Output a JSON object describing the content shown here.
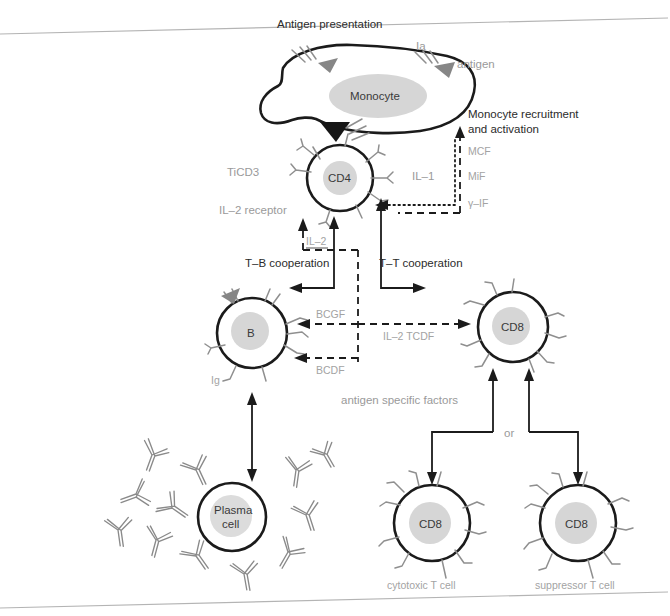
{
  "figure": {
    "title": "Antigen presentation",
    "domain": "immunology-cell-interaction-diagram"
  },
  "labels": {
    "antigen_presentation": "Antigen presentation",
    "ia": "Ia",
    "antigen": "antigen",
    "monocyte": "Monocyte",
    "monocyte_recruitment_line1": "Monocyte recruitment",
    "monocyte_recruitment_line2": "and activation",
    "mcf": "MCF",
    "mif": "MiF",
    "gamma_if": "γ–IF",
    "il1": "IL–1",
    "ticd3": "TiCD3",
    "cd4": "CD4",
    "il2_receptor": "IL–2 receptor",
    "il2": "IL–2",
    "tb_cooperation": "T–B cooperation",
    "tt_cooperation": "T–T cooperation",
    "b_cell": "B",
    "ig": "Ig",
    "bcgf": "BCGF",
    "bcdf": "BCDF",
    "il2_tcdf": "IL–2 TCDF",
    "cd8_top": "CD8",
    "antigen_specific_factors": "antigen specific factors",
    "or": "or",
    "cd8_left": "CD8",
    "cd8_right": "CD8",
    "cytotoxic_t_cell": "cytotoxic T cell",
    "suppressor_t_cell": "suppressor T cell",
    "plasma_cell_line1": "Plasma",
    "plasma_cell_line2": "cell"
  },
  "cells": [
    {
      "name": "monocyte",
      "label": "Monocyte",
      "shape": "amoeboid",
      "cx": 370,
      "cy": 92
    },
    {
      "name": "cd4-t-cell",
      "label": "CD4",
      "shape": "circle",
      "cx": 340,
      "cy": 178,
      "r": 33
    },
    {
      "name": "b-cell",
      "label": "B",
      "shape": "circle",
      "cx": 252,
      "cy": 333,
      "r": 35
    },
    {
      "name": "cd8-t-cell-top",
      "label": "CD8",
      "shape": "circle",
      "cx": 513,
      "cy": 327,
      "r": 35
    },
    {
      "name": "plasma-cell",
      "label": "Plasma cell",
      "shape": "circle",
      "cx": 232,
      "cy": 517,
      "r": 34
    },
    {
      "name": "cytotoxic-t-cell",
      "label": "CD8",
      "shape": "circle",
      "cx": 432,
      "cy": 523,
      "r": 38
    },
    {
      "name": "suppressor-t-cell",
      "label": "CD8",
      "shape": "circle",
      "cx": 578,
      "cy": 523,
      "r": 38
    }
  ],
  "colors": {
    "membrane_stroke": "#1b1b1b",
    "nucleus_fill": "#d6d6d6",
    "receptor_stroke": "#8f8f8f",
    "antigen_triangle": "#868686",
    "label_dark": "#2b2b2b",
    "label_gray": "#9a9a9a",
    "page_rule": "#b4b4b4",
    "background": "#ffffff"
  },
  "mediators": {
    "monocyte_to_cd4": [
      "IL–1"
    ],
    "cd4_to_monocyte": [
      "MCF",
      "MiF",
      "γ–IF"
    ],
    "cd4_to_b": [
      "BCGF",
      "BCDF"
    ],
    "cd4_to_cd8": [
      "IL–2 TCDF"
    ],
    "autocrine": [
      "IL–2"
    ]
  }
}
